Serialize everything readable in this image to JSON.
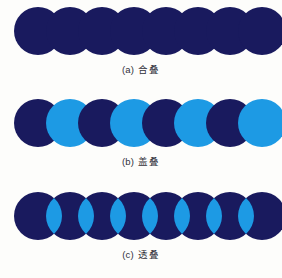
{
  "figure": {
    "background_color": "#fdfdfb",
    "panel_count": 3,
    "circle_count_per_panel": 8,
    "circle_diameter_px": 48,
    "circle_spacing_px": 32,
    "first_circle_center_x_px": 38,
    "colors": {
      "dark_navy": "#191a5e",
      "light_blue": "#1d9ae4",
      "caption_text": "#30303a",
      "background": "#fdfdfb"
    }
  },
  "panels": [
    {
      "id": "panel-a",
      "mode": "union",
      "caption_tag": "(a)",
      "caption_label": "合叠",
      "top_px": 0,
      "row_center_y_px": 31,
      "caption_y_px": 64,
      "description": "All eight circles merged into one silhouette in dark navy",
      "circle_fills": [
        "#191a5e",
        "#191a5e",
        "#191a5e",
        "#191a5e",
        "#191a5e",
        "#191a5e",
        "#191a5e",
        "#191a5e"
      ]
    },
    {
      "id": "panel-b",
      "mode": "cover",
      "caption_tag": "(b)",
      "caption_label": "盖叠",
      "top_px": 92,
      "row_center_y_px": 123,
      "caption_y_px": 156,
      "description": "Alternating dark navy and light blue circles, each stacked over the previous",
      "circle_fills": [
        "#191a5e",
        "#1d9ae4",
        "#191a5e",
        "#1d9ae4",
        "#191a5e",
        "#1d9ae4",
        "#191a5e",
        "#1d9ae4"
      ]
    },
    {
      "id": "panel-c",
      "mode": "transparent",
      "caption_tag": "(c)",
      "caption_label": "透叠",
      "top_px": 185,
      "row_center_y_px": 216,
      "caption_y_px": 249,
      "description": "Dark navy circles where neighbouring overlaps show as light blue lens shapes",
      "circle_fills": [
        "#191a5e",
        "#191a5e",
        "#191a5e",
        "#191a5e",
        "#191a5e",
        "#191a5e",
        "#191a5e",
        "#191a5e"
      ],
      "overlap_fill": "#1d9ae4",
      "overlap_count": 7
    }
  ]
}
